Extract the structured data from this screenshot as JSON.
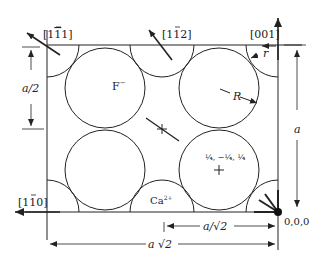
{
  "diagram": {
    "directions": {
      "d_111": "[1̄1]",
      "d_112": "[1̄2]",
      "d_001": "[001]",
      "d_110": "[1̄0]"
    },
    "direction_display": {
      "d_111": {
        "pre": "[1",
        "bar": "1",
        "post": "1]"
      },
      "d_112": {
        "pre": "[1",
        "bar": "1",
        "post": "2]"
      },
      "d_001": {
        "text": "[001]"
      },
      "d_110": {
        "pre": "[1",
        "bar": "1",
        "post": "0]"
      }
    },
    "labels": {
      "anion": "F⁻",
      "anion_base": "F",
      "anion_sup": "−",
      "cation": "Ca²⁺",
      "cation_base": "Ca",
      "cation_sup": "2+",
      "big_radius": "R",
      "small_radius": "r",
      "position": "¼, −¼, ¼",
      "origin": "0,0,0"
    },
    "dimensions": {
      "half_a": "a/2",
      "a": "a",
      "a_over_root2": "a/√2",
      "a_root2": "a √2"
    },
    "colors": {
      "line": "#222222",
      "background": "#ffffff"
    }
  }
}
